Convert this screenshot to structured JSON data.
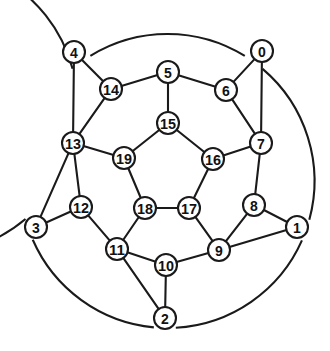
{
  "figure": {
    "name": "node-labelled-circular-graph",
    "kind": "graph-diagram",
    "background_color": "#ffffff",
    "stroke_color": "#1a1a1a",
    "node_fill_color": "#ffffff",
    "label_color": "#111111",
    "node_radius": 11,
    "edge_width": 2.1,
    "center": {
      "x": 167.5,
      "y": 181
    },
    "outer_ring_radius": 147
  },
  "chart_data": {
    "type": "diagram",
    "title": "",
    "layout": "three concentric rings: 5 outer hub nodes, 10 middle ring nodes, 5 inner pentagon nodes",
    "nodes": [
      {
        "id": "0",
        "label": "0",
        "x": 262,
        "y": 51,
        "ring": "outer"
      },
      {
        "id": "1",
        "label": "1",
        "x": 297,
        "y": 227,
        "ring": "outer"
      },
      {
        "id": "2",
        "label": "2",
        "x": 165,
        "y": 318,
        "ring": "outer"
      },
      {
        "id": "3",
        "label": "3",
        "x": 36,
        "y": 227,
        "ring": "outer"
      },
      {
        "id": "4",
        "label": "4",
        "x": 74,
        "y": 52,
        "ring": "outer"
      },
      {
        "id": "5",
        "label": "5",
        "x": 168,
        "y": 72,
        "ring": "middle"
      },
      {
        "id": "6",
        "label": "6",
        "x": 226,
        "y": 90,
        "ring": "middle"
      },
      {
        "id": "7",
        "label": "7",
        "x": 261,
        "y": 143,
        "ring": "middle"
      },
      {
        "id": "8",
        "label": "8",
        "x": 254,
        "y": 205,
        "ring": "middle"
      },
      {
        "id": "9",
        "label": "9",
        "x": 219,
        "y": 250,
        "ring": "middle"
      },
      {
        "id": "10",
        "label": "10",
        "x": 166,
        "y": 265,
        "ring": "middle"
      },
      {
        "id": "11",
        "label": "11",
        "x": 117,
        "y": 249,
        "ring": "middle"
      },
      {
        "id": "12",
        "label": "12",
        "x": 81,
        "y": 207,
        "ring": "middle"
      },
      {
        "id": "13",
        "label": "13",
        "x": 73,
        "y": 143,
        "ring": "middle"
      },
      {
        "id": "14",
        "label": "14",
        "x": 111,
        "y": 89,
        "ring": "middle"
      },
      {
        "id": "15",
        "label": "15",
        "x": 168,
        "y": 123,
        "ring": "inner"
      },
      {
        "id": "16",
        "label": "16",
        "x": 213,
        "y": 159,
        "ring": "inner"
      },
      {
        "id": "17",
        "label": "17",
        "x": 189,
        "y": 208,
        "ring": "inner"
      },
      {
        "id": "18",
        "label": "18",
        "x": 145,
        "y": 208,
        "ring": "inner"
      },
      {
        "id": "19",
        "label": "19",
        "x": 124,
        "y": 158,
        "ring": "inner"
      }
    ],
    "straight_edges": [
      [
        "4",
        "14"
      ],
      [
        "14",
        "5"
      ],
      [
        "5",
        "6"
      ],
      [
        "6",
        "0"
      ],
      [
        "0",
        "7"
      ],
      [
        "7",
        "8"
      ],
      [
        "8",
        "1"
      ],
      [
        "1",
        "9"
      ],
      [
        "9",
        "10"
      ],
      [
        "10",
        "2"
      ],
      [
        "2",
        "11"
      ],
      [
        "11",
        "12"
      ],
      [
        "12",
        "3"
      ],
      [
        "3",
        "13"
      ],
      [
        "13",
        "4"
      ],
      [
        "5",
        "15"
      ],
      [
        "7",
        "16"
      ],
      [
        "9",
        "17"
      ],
      [
        "11",
        "18"
      ],
      [
        "13",
        "19"
      ],
      [
        "15",
        "16"
      ],
      [
        "16",
        "17"
      ],
      [
        "17",
        "18"
      ],
      [
        "18",
        "19"
      ],
      [
        "19",
        "15"
      ],
      [
        "14",
        "13"
      ],
      [
        "6",
        "7"
      ],
      [
        "8",
        "9"
      ],
      [
        "10",
        "11"
      ],
      [
        "12",
        "13"
      ]
    ],
    "outer_ring_arcs": [
      {
        "from": "0",
        "to": "4",
        "description": "arc over the top through the 12 o'clock position"
      },
      {
        "from": "0",
        "to": "1",
        "description": "arc on the right side"
      },
      {
        "from": "1",
        "to": "2",
        "description": "arc on the lower right"
      },
      {
        "from": "2",
        "to": "3",
        "description": "arc on the lower left"
      },
      {
        "from": "3",
        "to": "4",
        "description": "arc on the left side"
      }
    ],
    "node_count": 20,
    "outer_node_labels": [
      "0",
      "1",
      "2",
      "3",
      "4"
    ],
    "middle_node_labels": [
      "5",
      "6",
      "7",
      "8",
      "9",
      "10",
      "11",
      "12",
      "13",
      "14"
    ],
    "inner_node_labels": [
      "15",
      "16",
      "17",
      "18",
      "19"
    ]
  }
}
